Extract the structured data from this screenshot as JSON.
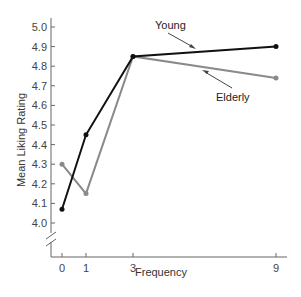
{
  "chart_data": {
    "type": "line",
    "title": "",
    "xlabel": "Frequency",
    "ylabel": "Mean Liking Rating",
    "x": [
      0,
      1,
      3,
      9
    ],
    "x_tick_labels": [
      "0",
      "1",
      "3",
      "9"
    ],
    "y_tick_labels": [
      "4.0",
      "4.1",
      "4.2",
      "4.3",
      "4.4",
      "4.5",
      "4.6",
      "4.7",
      "4.8",
      "4.9",
      "5.0"
    ],
    "ylim": [
      4.0,
      5.0
    ],
    "y_axis_break": true,
    "grid": false,
    "legend": "inline annotations with arrows",
    "series": [
      {
        "name": "Young",
        "color": "#111111",
        "values": [
          4.07,
          4.45,
          4.85,
          4.9
        ]
      },
      {
        "name": "Elderly",
        "color": "#8a8a8a",
        "values": [
          4.3,
          4.15,
          4.85,
          4.74
        ]
      }
    ]
  }
}
